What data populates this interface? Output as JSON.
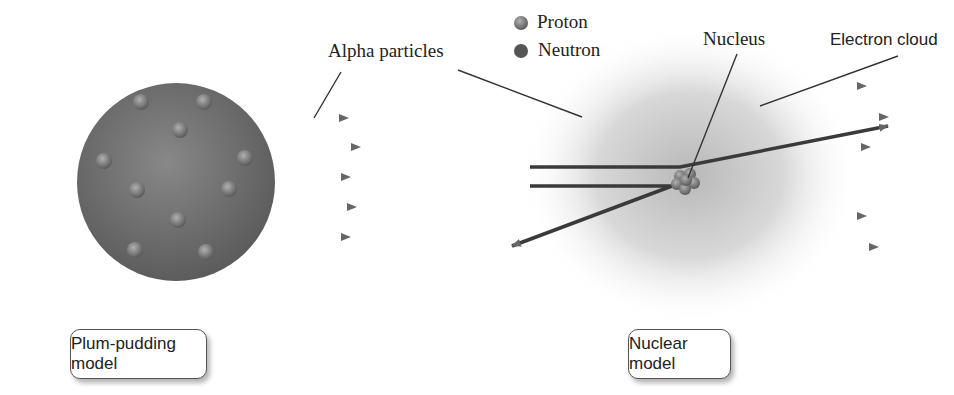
{
  "labels": {
    "alpha_particles": "Alpha particles",
    "proton": "Proton",
    "neutron": "Neutron",
    "nucleus": "Nucleus",
    "electron_cloud": "Electron cloud"
  },
  "captions": {
    "plum_pudding": "Plum-pudding model",
    "nuclear": "Nuclear model"
  },
  "colors": {
    "sphere": "#6e6e6e",
    "arrow": "#2a2a2a",
    "particle": "#8a8a8a"
  }
}
